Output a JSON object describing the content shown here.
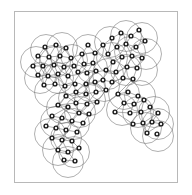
{
  "figure": {
    "kind": "network-graph-with-coverage-disks",
    "caption": "",
    "background_color": "#ffffff",
    "frame": {
      "visible": true,
      "color": "#b8b8b8",
      "x": 14,
      "y": 11,
      "width": 164,
      "height": 172
    },
    "style": {
      "node_ring_color": "#1a1a1a",
      "node_fill_color": "#f2f2f2",
      "edge_color": "#8a8a8a",
      "bubble_color": "#6e6e6e",
      "node_radius": 2.6,
      "node_inner_radius": 1.2,
      "bubble_radius": 15.5
    },
    "counts": {
      "nodes": 96,
      "edges": 132,
      "disks": 41
    }
  },
  "chart_data": {
    "type": "scatter",
    "title": "",
    "xlabel": "",
    "ylabel": "",
    "xlim": [
      14,
      178
    ],
    "ylim": [
      11,
      183
    ],
    "grid": false,
    "legend": null,
    "nodes": [
      [
        45,
        47
      ],
      [
        56,
        45
      ],
      [
        66,
        48
      ],
      [
        38,
        56
      ],
      [
        49,
        57
      ],
      [
        60,
        56
      ],
      [
        71,
        58
      ],
      [
        33,
        66
      ],
      [
        43,
        66
      ],
      [
        54,
        65
      ],
      [
        64,
        67
      ],
      [
        74,
        66
      ],
      [
        38,
        75
      ],
      [
        48,
        76
      ],
      [
        58,
        74
      ],
      [
        68,
        76
      ],
      [
        44,
        85
      ],
      [
        55,
        84
      ],
      [
        65,
        86
      ],
      [
        75,
        84
      ],
      [
        82,
        54
      ],
      [
        88,
        45
      ],
      [
        95,
        53
      ],
      [
        84,
        64
      ],
      [
        93,
        63
      ],
      [
        78,
        72
      ],
      [
        87,
        73
      ],
      [
        96,
        71
      ],
      [
        103,
        45
      ],
      [
        112,
        38
      ],
      [
        121,
        33
      ],
      [
        131,
        36
      ],
      [
        139,
        30
      ],
      [
        108,
        54
      ],
      [
        117,
        47
      ],
      [
        126,
        44
      ],
      [
        136,
        47
      ],
      [
        145,
        41
      ],
      [
        113,
        62
      ],
      [
        122,
        57
      ],
      [
        132,
        56
      ],
      [
        142,
        58
      ],
      [
        106,
        70
      ],
      [
        116,
        72
      ],
      [
        127,
        67
      ],
      [
        137,
        68
      ],
      [
        103,
        80
      ],
      [
        112,
        82
      ],
      [
        123,
        78
      ],
      [
        133,
        79
      ],
      [
        86,
        84
      ],
      [
        95,
        82
      ],
      [
        76,
        92
      ],
      [
        86,
        94
      ],
      [
        96,
        92
      ],
      [
        106,
        90
      ],
      [
        66,
        96
      ],
      [
        76,
        103
      ],
      [
        87,
        104
      ],
      [
        97,
        102
      ],
      [
        58,
        105
      ],
      [
        68,
        107
      ],
      [
        79,
        113
      ],
      [
        89,
        114
      ],
      [
        52,
        116
      ],
      [
        62,
        118
      ],
      [
        72,
        121
      ],
      [
        83,
        123
      ],
      [
        46,
        126
      ],
      [
        56,
        128
      ],
      [
        66,
        130
      ],
      [
        77,
        132
      ],
      [
        52,
        138
      ],
      [
        62,
        140
      ],
      [
        72,
        141
      ],
      [
        58,
        150
      ],
      [
        68,
        152
      ],
      [
        79,
        148
      ],
      [
        64,
        160
      ],
      [
        75,
        161
      ],
      [
        118,
        94
      ],
      [
        128,
        92
      ],
      [
        138,
        96
      ],
      [
        124,
        103
      ],
      [
        134,
        104
      ],
      [
        144,
        100
      ],
      [
        115,
        112
      ],
      [
        130,
        113
      ],
      [
        141,
        112
      ],
      [
        150,
        107
      ],
      [
        158,
        113
      ],
      [
        152,
        122
      ],
      [
        161,
        124
      ],
      [
        143,
        123
      ],
      [
        133,
        124
      ],
      [
        147,
        133
      ],
      [
        157,
        134
      ]
    ],
    "edges": [
      [
        0,
        1
      ],
      [
        1,
        2
      ],
      [
        0,
        3
      ],
      [
        0,
        4
      ],
      [
        1,
        4
      ],
      [
        1,
        5
      ],
      [
        2,
        5
      ],
      [
        2,
        6
      ],
      [
        3,
        4
      ],
      [
        4,
        5
      ],
      [
        5,
        6
      ],
      [
        3,
        7
      ],
      [
        3,
        8
      ],
      [
        4,
        8
      ],
      [
        4,
        9
      ],
      [
        5,
        9
      ],
      [
        5,
        10
      ],
      [
        6,
        10
      ],
      [
        6,
        11
      ],
      [
        7,
        8
      ],
      [
        8,
        9
      ],
      [
        9,
        10
      ],
      [
        10,
        11
      ],
      [
        7,
        12
      ],
      [
        8,
        12
      ],
      [
        8,
        13
      ],
      [
        9,
        13
      ],
      [
        9,
        14
      ],
      [
        10,
        14
      ],
      [
        10,
        15
      ],
      [
        11,
        15
      ],
      [
        12,
        13
      ],
      [
        13,
        14
      ],
      [
        14,
        15
      ],
      [
        12,
        16
      ],
      [
        13,
        16
      ],
      [
        13,
        17
      ],
      [
        14,
        17
      ],
      [
        14,
        18
      ],
      [
        15,
        18
      ],
      [
        15,
        19
      ],
      [
        16,
        17
      ],
      [
        17,
        18
      ],
      [
        18,
        19
      ],
      [
        6,
        20
      ],
      [
        20,
        21
      ],
      [
        21,
        22
      ],
      [
        20,
        22
      ],
      [
        20,
        23
      ],
      [
        22,
        24
      ],
      [
        23,
        24
      ],
      [
        23,
        25
      ],
      [
        24,
        26
      ],
      [
        25,
        26
      ],
      [
        26,
        27
      ],
      [
        24,
        27
      ],
      [
        22,
        28
      ],
      [
        28,
        29
      ],
      [
        29,
        30
      ],
      [
        30,
        31
      ],
      [
        31,
        32
      ],
      [
        29,
        33
      ],
      [
        28,
        33
      ],
      [
        33,
        34
      ],
      [
        34,
        35
      ],
      [
        35,
        36
      ],
      [
        36,
        37
      ],
      [
        30,
        34
      ],
      [
        31,
        35
      ],
      [
        32,
        37
      ],
      [
        33,
        38
      ],
      [
        34,
        39
      ],
      [
        35,
        40
      ],
      [
        36,
        41
      ],
      [
        38,
        39
      ],
      [
        39,
        40
      ],
      [
        40,
        41
      ],
      [
        38,
        42
      ],
      [
        39,
        43
      ],
      [
        40,
        44
      ],
      [
        41,
        45
      ],
      [
        42,
        43
      ],
      [
        43,
        44
      ],
      [
        44,
        45
      ],
      [
        42,
        46
      ],
      [
        43,
        47
      ],
      [
        44,
        48
      ],
      [
        45,
        49
      ],
      [
        46,
        47
      ],
      [
        47,
        48
      ],
      [
        48,
        49
      ],
      [
        27,
        50
      ],
      [
        50,
        51
      ],
      [
        51,
        46
      ],
      [
        27,
        52
      ],
      [
        52,
        53
      ],
      [
        53,
        54
      ],
      [
        54,
        55
      ],
      [
        55,
        51
      ],
      [
        50,
        53
      ],
      [
        51,
        54
      ],
      [
        46,
        55
      ],
      [
        52,
        56
      ],
      [
        56,
        57
      ],
      [
        57,
        58
      ],
      [
        58,
        59
      ],
      [
        53,
        57
      ],
      [
        54,
        58
      ],
      [
        55,
        59
      ],
      [
        57,
        60
      ],
      [
        56,
        60
      ],
      [
        60,
        61
      ],
      [
        61,
        62
      ],
      [
        62,
        63
      ],
      [
        58,
        62
      ],
      [
        59,
        63
      ],
      [
        61,
        64
      ],
      [
        64,
        65
      ],
      [
        65,
        66
      ],
      [
        66,
        67
      ],
      [
        62,
        66
      ],
      [
        63,
        67
      ],
      [
        64,
        68
      ],
      [
        68,
        69
      ],
      [
        69,
        70
      ],
      [
        70,
        71
      ],
      [
        65,
        69
      ],
      [
        66,
        70
      ],
      [
        67,
        71
      ],
      [
        69,
        72
      ],
      [
        72,
        73
      ],
      [
        73,
        74
      ],
      [
        70,
        73
      ],
      [
        71,
        74
      ],
      [
        72,
        75
      ],
      [
        75,
        76
      ],
      [
        76,
        77
      ],
      [
        73,
        76
      ],
      [
        74,
        77
      ],
      [
        75,
        78
      ],
      [
        78,
        79
      ],
      [
        76,
        79
      ],
      [
        49,
        80
      ],
      [
        80,
        81
      ],
      [
        81,
        82
      ],
      [
        80,
        83
      ],
      [
        82,
        85
      ],
      [
        83,
        84
      ],
      [
        84,
        85
      ],
      [
        83,
        86
      ],
      [
        86,
        87
      ],
      [
        87,
        88
      ],
      [
        84,
        87
      ],
      [
        85,
        88
      ],
      [
        85,
        89
      ],
      [
        89,
        90
      ],
      [
        90,
        91
      ],
      [
        91,
        92
      ],
      [
        89,
        91
      ],
      [
        88,
        93
      ],
      [
        93,
        90
      ],
      [
        93,
        94
      ],
      [
        86,
        94
      ],
      [
        92,
        95
      ],
      [
        91,
        95
      ],
      [
        93,
        95
      ]
    ],
    "disks": [
      [
        46,
        50
      ],
      [
        62,
        48
      ],
      [
        36,
        62
      ],
      [
        55,
        62
      ],
      [
        72,
        60
      ],
      [
        40,
        78
      ],
      [
        58,
        78
      ],
      [
        74,
        80
      ],
      [
        50,
        92
      ],
      [
        88,
        50
      ],
      [
        92,
        68
      ],
      [
        110,
        42
      ],
      [
        126,
        36
      ],
      [
        142,
        38
      ],
      [
        112,
        58
      ],
      [
        130,
        52
      ],
      [
        146,
        54
      ],
      [
        108,
        74
      ],
      [
        126,
        70
      ],
      [
        142,
        70
      ],
      [
        90,
        86
      ],
      [
        104,
        86
      ],
      [
        74,
        98
      ],
      [
        90,
        100
      ],
      [
        62,
        108
      ],
      [
        80,
        112
      ],
      [
        56,
        122
      ],
      [
        74,
        124
      ],
      [
        50,
        134
      ],
      [
        66,
        138
      ],
      [
        58,
        150
      ],
      [
        74,
        152
      ],
      [
        68,
        162
      ],
      [
        124,
        94
      ],
      [
        140,
        96
      ],
      [
        122,
        110
      ],
      [
        138,
        112
      ],
      [
        154,
        112
      ],
      [
        158,
        124
      ],
      [
        146,
        128
      ],
      [
        158,
        136
      ]
    ]
  }
}
